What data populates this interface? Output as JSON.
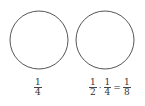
{
  "diagram": {
    "circles": [
      {
        "id": "left",
        "cx": 39,
        "cy": 40,
        "r": 29,
        "stroke": "#555555"
      },
      {
        "id": "right",
        "cx": 105,
        "cy": 40,
        "r": 29,
        "stroke": "#555555"
      }
    ],
    "left_label": {
      "num": "1",
      "den": "4"
    },
    "right_label": {
      "a": {
        "num": "1",
        "den": "2"
      },
      "op1": "·",
      "b": {
        "num": "1",
        "den": "4"
      },
      "op2": "=",
      "c": {
        "num": "1",
        "den": "8"
      }
    }
  }
}
